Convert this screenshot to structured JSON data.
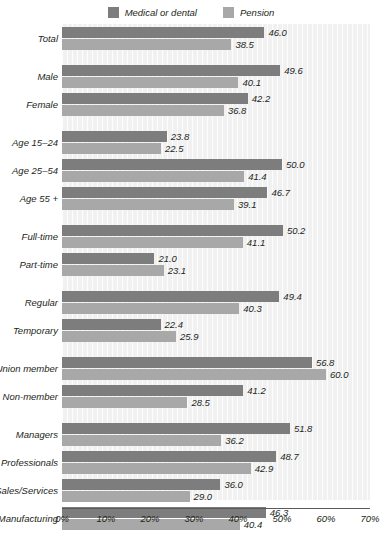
{
  "chart_data": {
    "type": "bar",
    "orientation": "horizontal",
    "title": "",
    "xlabel": "",
    "ylabel": "",
    "xlim": [
      0,
      70
    ],
    "grid": false,
    "legend_position": "top-center",
    "categories": [
      "Total",
      "Male",
      "Female",
      "Age 15–24",
      "Age 25–54",
      "Age 55 +",
      "Full-time",
      "Part-time",
      "Regular",
      "Temporary",
      "Union member",
      "Non-member",
      "Managers",
      "Professionals",
      "Sales/Services",
      "Manufacturing"
    ],
    "series": [
      {
        "name": "Medical or dental",
        "color": "#7d7d7d",
        "values": [
          46.0,
          49.6,
          42.2,
          23.8,
          50.0,
          46.7,
          50.2,
          21.0,
          49.4,
          22.4,
          56.8,
          41.2,
          51.8,
          48.7,
          36.0,
          46.3
        ],
        "labels": [
          "46.0",
          "49.6",
          "42.2",
          "23.8",
          "50.0",
          "46.7",
          "50.2",
          "21.0",
          "49.4",
          "22.4",
          "56.8",
          "41.2",
          "51.8",
          "48.7",
          "36.0",
          "46.3"
        ]
      },
      {
        "name": "Pension",
        "color": "#a8a8a8",
        "values": [
          38.5,
          40.1,
          36.8,
          22.5,
          41.4,
          39.1,
          41.1,
          23.1,
          40.3,
          25.9,
          60.0,
          28.5,
          36.2,
          42.9,
          29.0,
          40.4
        ],
        "labels": [
          "38.5",
          "40.1",
          "36.8",
          "22.5",
          "41.4",
          "39.1",
          "41.1",
          "23.1",
          "40.3",
          "25.9",
          "60.0",
          "28.5",
          "36.2",
          "42.9",
          "29.0",
          "40.4"
        ]
      }
    ],
    "group_breaks_before": [
      1,
      3,
      6,
      8,
      10,
      12
    ],
    "xticks": [
      0,
      10,
      20,
      30,
      40,
      50,
      60,
      70
    ],
    "xtick_labels": [
      "0%",
      "10%",
      "20%",
      "30%",
      "40%",
      "50%",
      "60%",
      "70%"
    ]
  },
  "legend": {
    "items": [
      {
        "label": "Medical or dental",
        "color": "#7d7d7d"
      },
      {
        "label": "Pension",
        "color": "#a8a8a8"
      }
    ]
  },
  "colors": {
    "medical": "#7d7d7d",
    "pension": "#a8a8a8",
    "plot_background": "#f1f1f1",
    "axis": "#5a5a5a",
    "text": "#231f20"
  }
}
